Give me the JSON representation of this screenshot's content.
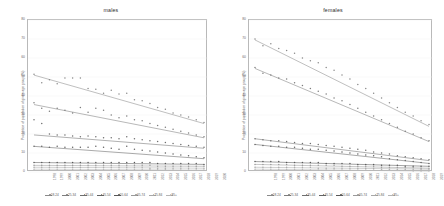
{
  "figure": {
    "panels": [
      {
        "title": "males"
      },
      {
        "title": "females"
      }
    ],
    "ylabel": "Proportion of population of given age group (%)"
  },
  "chart_data": {
    "type": "scatter",
    "title": "",
    "xlabel": "",
    "ylabel": "Proportion of population of given age group (%)",
    "ylim": [
      0,
      80
    ],
    "yticks": [
      0,
      10,
      20,
      30,
      40,
      50,
      60,
      70,
      80
    ],
    "grid": true,
    "legend_position": "bottom",
    "x": [
      1998,
      1999,
      2000,
      2001,
      2002,
      2003,
      2004,
      2005,
      2006,
      2007,
      2008,
      2009,
      2010,
      2011,
      2012,
      2013,
      2014,
      2015,
      2016,
      2017,
      2018,
      2019,
      2020
    ],
    "xticklabels": [
      "1998",
      "1999",
      "2000",
      "2001",
      "2002",
      "2003",
      "2004",
      "2005",
      "2006",
      "2007",
      "2008",
      "2009",
      "2010",
      "2011",
      "2012",
      "2013",
      "2014",
      "2015",
      "2016",
      "2017",
      "2018",
      "2019",
      "2020"
    ],
    "series_names": [
      "18-24",
      "25-34",
      "35-44",
      "45-54",
      "55-64",
      "65-74",
      "75-84",
      "85+"
    ],
    "colors": [
      "#8a8a8a",
      "#7d7d7d",
      "#6f6f6f",
      "#636363",
      "#585858",
      "#9a9a9a",
      "#a8a8a8",
      "#b5b5b5"
    ],
    "panels": [
      {
        "name": "males",
        "series": [
          {
            "name": "18-24",
            "values": [
              51.5,
              47.0,
              48.5,
              46.5,
              49.5,
              49.5,
              49.5,
              44.0,
              43.5,
              41.5,
              43.0,
              41.0,
              41.5,
              38.0,
              37.5,
              36.0,
              34.0,
              33.0,
              31.0,
              30.0,
              29.0,
              27.5,
              26.0
            ],
            "fit": {
              "start": 51.0,
              "end": 25.5
            }
          },
          {
            "name": "25-34",
            "values": [
              36.5,
              33.5,
              32.0,
              33.5,
              32.5,
              31.0,
              34.0,
              31.5,
              33.5,
              32.5,
              30.0,
              28.5,
              29.5,
              27.5,
              27.0,
              25.5,
              24.5,
              23.5,
              22.5,
              21.5,
              20.5,
              19.5,
              18.5
            ],
            "fit": {
              "start": 35.5,
              "end": 18.0
            }
          },
          {
            "name": "35-44",
            "values": [
              27.5,
              25.5,
              20.0,
              19.5,
              19.5,
              19.0,
              18.5,
              19.0,
              18.5,
              18.0,
              18.0,
              17.5,
              18.5,
              17.5,
              17.0,
              16.5,
              16.0,
              15.5,
              15.0,
              14.5,
              14.0,
              13.5,
              13.0
            ],
            "fit": {
              "start": 19.5,
              "end": 12.5
            }
          },
          {
            "name": "45-54",
            "values": [
              13.5,
              13.5,
              13.0,
              13.5,
              13.0,
              13.0,
              13.0,
              13.0,
              13.5,
              13.0,
              12.5,
              12.0,
              13.5,
              12.0,
              11.5,
              11.0,
              10.5,
              10.0,
              9.5,
              9.0,
              8.5,
              8.0,
              7.5
            ],
            "fit": {
              "start": 13.5,
              "end": 7.0
            }
          },
          {
            "name": "55-64",
            "values": [
              5.0,
              5.0,
              5.0,
              5.0,
              5.0,
              5.0,
              5.0,
              5.0,
              5.0,
              5.0,
              5.0,
              5.0,
              5.0,
              5.0,
              5.0,
              5.0,
              4.5,
              4.5,
              4.5,
              4.5,
              4.5,
              4.5,
              4.0
            ],
            "fit": {
              "start": 5.0,
              "end": 4.0
            }
          },
          {
            "name": "65-74",
            "values": [
              3.5,
              3.5,
              3.5,
              3.5,
              3.5,
              3.5,
              3.5,
              3.5,
              3.5,
              3.5,
              3.5,
              3.5,
              3.5,
              3.5,
              3.5,
              3.5,
              3.0,
              3.0,
              3.0,
              3.0,
              3.0,
              3.0,
              3.0
            ],
            "fit": {
              "start": 3.5,
              "end": 3.0
            }
          },
          {
            "name": "75-84",
            "values": [
              2.5,
              2.5,
              2.5,
              2.5,
              2.5,
              2.5,
              2.5,
              2.5,
              2.5,
              2.5,
              2.5,
              2.5,
              2.5,
              2.5,
              2.5,
              2.0,
              2.0,
              2.0,
              2.0,
              2.0,
              2.0,
              2.0,
              2.0
            ],
            "fit": {
              "start": 2.5,
              "end": 2.0
            }
          },
          {
            "name": "85+",
            "values": [
              1.5,
              1.5,
              1.5,
              1.5,
              1.5,
              1.5,
              1.5,
              1.5,
              1.5,
              1.5,
              1.5,
              1.5,
              1.5,
              1.5,
              1.5,
              1.5,
              1.5,
              1.5,
              1.0,
              1.0,
              1.0,
              1.0,
              1.0
            ],
            "fit": {
              "start": 1.5,
              "end": 1.0
            }
          }
        ]
      },
      {
        "name": "females",
        "series": [
          {
            "name": "18-24",
            "values": [
              70.0,
              66.5,
              67.5,
              65.0,
              64.0,
              62.5,
              60.0,
              58.5,
              57.5,
              55.0,
              53.5,
              51.0,
              49.0,
              46.0,
              44.0,
              41.5,
              39.0,
              36.5,
              34.0,
              31.5,
              29.5,
              27.0,
              25.0
            ],
            "fit": {
              "start": 69.5,
              "end": 24.0
            }
          },
          {
            "name": "25-34",
            "values": [
              55.0,
              52.0,
              51.0,
              49.5,
              49.0,
              47.0,
              45.5,
              44.0,
              42.5,
              41.0,
              39.0,
              37.5,
              35.5,
              33.5,
              31.5,
              29.5,
              27.5,
              25.5,
              23.5,
              21.5,
              20.0,
              18.0,
              16.5
            ],
            "fit": {
              "start": 54.5,
              "end": 16.0
            }
          },
          {
            "name": "35-44",
            "values": [
              17.5,
              17.0,
              16.5,
              16.5,
              16.0,
              15.5,
              15.0,
              15.0,
              14.5,
              14.0,
              13.5,
              13.0,
              12.5,
              12.0,
              11.5,
              10.5,
              10.0,
              9.5,
              8.5,
              8.0,
              7.5,
              7.0,
              6.5
            ],
            "fit": {
              "start": 17.5,
              "end": 6.0
            }
          },
          {
            "name": "45-54",
            "values": [
              14.5,
              14.0,
              13.5,
              13.5,
              13.0,
              13.0,
              12.5,
              12.0,
              12.0,
              11.5,
              11.0,
              10.5,
              10.0,
              9.5,
              9.0,
              8.5,
              8.0,
              7.0,
              6.5,
              6.0,
              5.5,
              5.0,
              4.5
            ],
            "fit": {
              "start": 14.5,
              "end": 4.5
            }
          },
          {
            "name": "55-64",
            "values": [
              5.5,
              5.5,
              5.5,
              5.5,
              5.0,
              5.0,
              5.0,
              5.0,
              5.0,
              4.5,
              4.5,
              4.5,
              4.5,
              4.0,
              4.0,
              4.0,
              3.5,
              3.5,
              3.5,
              3.0,
              3.0,
              3.0,
              3.0
            ],
            "fit": {
              "start": 5.5,
              "end": 3.0
            }
          },
          {
            "name": "65-74",
            "values": [
              4.0,
              4.0,
              4.0,
              4.0,
              4.0,
              3.5,
              3.5,
              3.5,
              3.5,
              3.5,
              3.5,
              3.0,
              3.0,
              3.0,
              3.0,
              3.0,
              2.5,
              2.5,
              2.5,
              2.5,
              2.5,
              2.0,
              2.0
            ],
            "fit": {
              "start": 4.0,
              "end": 2.0
            }
          },
          {
            "name": "75-84",
            "values": [
              2.5,
              2.5,
              2.5,
              2.5,
              2.5,
              2.5,
              2.5,
              2.5,
              2.0,
              2.0,
              2.0,
              2.0,
              2.0,
              2.0,
              2.0,
              2.0,
              1.5,
              1.5,
              1.5,
              1.5,
              1.5,
              1.5,
              1.5
            ],
            "fit": {
              "start": 2.5,
              "end": 1.5
            }
          },
          {
            "name": "85+",
            "values": [
              1.5,
              1.5,
              1.5,
              1.5,
              1.5,
              1.5,
              1.5,
              1.0,
              1.0,
              1.0,
              1.0,
              1.0,
              1.0,
              1.0,
              1.0,
              1.0,
              1.0,
              1.0,
              1.0,
              1.0,
              0.5,
              0.5,
              0.5
            ],
            "fit": {
              "start": 1.5,
              "end": 0.5
            }
          }
        ]
      }
    ]
  }
}
